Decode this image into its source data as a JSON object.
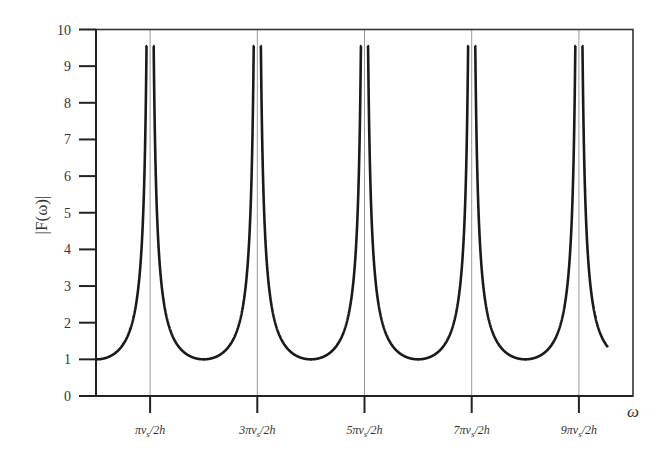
{
  "chart_data": {
    "type": "line",
    "title": "",
    "xlabel": "ω",
    "ylabel": "|F(ω)|",
    "ylim": [
      0,
      10
    ],
    "yticks": [
      0,
      1,
      2,
      3,
      4,
      5,
      6,
      7,
      8,
      9,
      10
    ],
    "xticks": [
      {
        "label": "πv_s/2h",
        "main": "πv",
        "sub": "s",
        "tail": "/2h",
        "theta_over_pi": 0.5
      },
      {
        "label": "3πv_s/2h",
        "main": "3πv",
        "sub": "s",
        "tail": "/2h",
        "theta_over_pi": 1.5
      },
      {
        "label": "5πv_s/2h",
        "main": "5πv",
        "sub": "s",
        "tail": "/2h",
        "theta_over_pi": 2.5
      },
      {
        "label": "7πv_s/2h",
        "main": "7πv",
        "sub": "s",
        "tail": "/2h",
        "theta_over_pi": 3.5
      },
      {
        "label": "9πv_s/2h",
        "main": "9πv",
        "sub": "s",
        "tail": "/2h",
        "theta_over_pi": 4.5
      }
    ],
    "xrange_theta_over_pi": [
      0,
      4.77
    ],
    "grid": "vertical lines at resonance frequencies",
    "series": [
      {
        "name": "|F(ω)| amplification function",
        "formula": "1/|cos(ωh/v_s)| clipped near resonance",
        "peak_value": 9.55,
        "min_value": 1.0,
        "start_value": 1.0,
        "end_value": 1.33,
        "resonance_peaks_at": [
          "πv_s/2h",
          "3πv_s/2h",
          "5πv_s/2h",
          "7πv_s/2h",
          "9πv_s/2h"
        ],
        "minima_at_theta_over_pi": [
          0,
          1,
          2,
          3,
          4
        ]
      }
    ],
    "colors": {
      "curve": "#1a1a1a",
      "axis": "#333333",
      "grid": "#9a9a9a"
    }
  }
}
